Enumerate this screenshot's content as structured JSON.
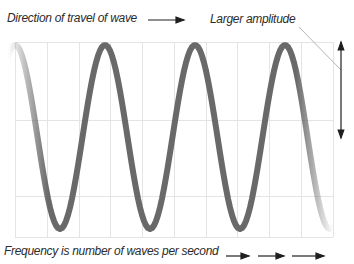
{
  "labels": {
    "direction": "Direction of travel of wave",
    "amplitude": "Larger amplitude",
    "frequency": "Frequency is number of waves per second"
  },
  "colors": {
    "wave": "#696969",
    "grid": "#e4e4e4",
    "text": "#2b2b2b",
    "arrow": "#1f1f1f",
    "pointer": "#b4b4b4",
    "background": "#ffffff"
  },
  "wave": {
    "x_start": 8,
    "x_end": 333,
    "crest_x": 15,
    "period": 90,
    "midline": 137,
    "amplitude": 92,
    "stroke_width": 6,
    "fade_in_end": 48,
    "fade_out_start": 296
  },
  "grid": {
    "x0": 15,
    "x1": 333,
    "y0": 42,
    "y1": 237,
    "v_lines": [
      15,
      47,
      79,
      110,
      142,
      174,
      206,
      237,
      269,
      301,
      333
    ],
    "h_lines": [
      42,
      120,
      196,
      237
    ]
  },
  "arrows": {
    "direction": {
      "x1": 148,
      "y1": 20,
      "x2": 184,
      "y2": 20
    },
    "amplitude": {
      "x1": 341,
      "y1": 138,
      "x2": 341,
      "y2": 42,
      "double": true
    },
    "pointer": {
      "x1": 299,
      "y1": 27,
      "x2": 341,
      "y2": 70
    },
    "frequency": [
      {
        "x1": 226,
        "y1": 256,
        "x2": 249,
        "y2": 256
      },
      {
        "x1": 258,
        "y1": 256,
        "x2": 284,
        "y2": 256
      },
      {
        "x1": 292,
        "y1": 256,
        "x2": 324,
        "y2": 256
      }
    ]
  }
}
